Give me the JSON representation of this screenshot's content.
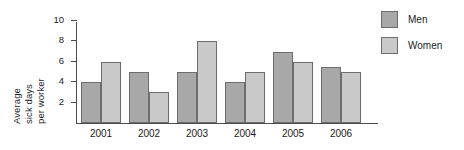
{
  "chart_data": {
    "type": "bar",
    "title": "",
    "xlabel": "",
    "ylabel": "Average sick days per worker",
    "ylabel_lines": [
      "Average",
      "sick days",
      "per worker"
    ],
    "categories": [
      "2001",
      "2002",
      "2003",
      "2004",
      "2005",
      "2006"
    ],
    "series": [
      {
        "name": "Men",
        "color": "#a8a8a8",
        "values": [
          4,
          5,
          5,
          4,
          7,
          5.5
        ]
      },
      {
        "name": "Women",
        "color": "#c9c9c9",
        "values": [
          6,
          3,
          8,
          5,
          6,
          5
        ]
      }
    ],
    "ylim": [
      0,
      10
    ],
    "ytick_labels": [
      "10",
      "8",
      "6",
      "4",
      "2"
    ],
    "ytick_values": [
      10,
      8,
      6,
      4,
      2
    ],
    "grid": false,
    "legend_position": "right"
  },
  "legend": {
    "entries": [
      {
        "label": "Men",
        "color": "#a8a8a8"
      },
      {
        "label": "Women",
        "color": "#c9c9c9"
      }
    ]
  }
}
